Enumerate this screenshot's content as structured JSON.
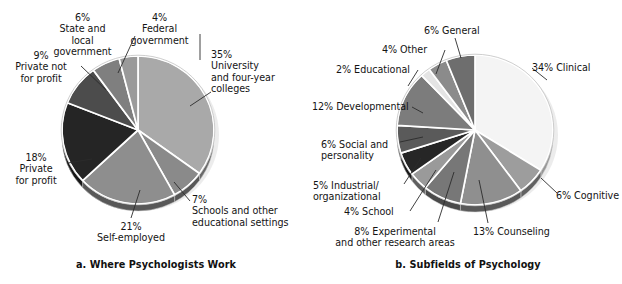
{
  "figure": {
    "panels": [
      {
        "id": "a",
        "caption": "a. Where Psychologists Work",
        "chart_index": 0
      },
      {
        "id": "b",
        "caption": "b. Subfields of Psychology",
        "chart_index": 1
      }
    ]
  },
  "chart_data": [
    {
      "type": "pie",
      "title": "a. Where Psychologists Work",
      "xlabel": "",
      "ylabel": "",
      "legend": "labels-with-leader-lines",
      "start_angle_deg": 0,
      "direction": "clockwise",
      "categories": [
        "University and four-year colleges",
        "Schools and other educational settings",
        "Self-employed",
        "Private for profit",
        "Private not for profit",
        "State and local government",
        "Federal government"
      ],
      "values": [
        35,
        7,
        21,
        18,
        9,
        6,
        4
      ],
      "labels": [
        "35%\nUniversity\nand four-year\ncolleges",
        "7%\nSchools and other\neducational settings",
        "21%\nSelf-employed",
        "18%\nPrivate\nfor profit",
        "9%\nPrivate not\nfor profit",
        "6%\nState and\nlocal\ngovernment",
        "4%\nFederal\ngovernment"
      ],
      "colors": [
        "#a9a9a9",
        "#8a8a8a",
        "#8e8e8e",
        "#252525",
        "#4c4c4c",
        "#7f7f7f",
        "#9a9a9a"
      ]
    },
    {
      "type": "pie",
      "title": "b. Subfields of Psychology",
      "xlabel": "",
      "ylabel": "",
      "legend": "labels-with-leader-lines",
      "start_angle_deg": 0,
      "direction": "clockwise",
      "categories": [
        "Clinical",
        "Cognitive",
        "Counseling",
        "Experimental and other research areas",
        "School",
        "Industrial/organizational",
        "Social and personality",
        "Developmental",
        "Educational",
        "Other",
        "General"
      ],
      "values": [
        34,
        6,
        13,
        8,
        4,
        5,
        6,
        12,
        2,
        4,
        6
      ],
      "labels": [
        "34% Clinical",
        "6% Cognitive",
        "13% Counseling",
        "8% Experimental\nand other research areas",
        "4% School",
        "5% Industrial/\norganizational",
        "6% Social and\npersonality",
        "12% Developmental",
        "2% Educational",
        "4% Other",
        "6% General"
      ],
      "colors": [
        "#f4f4f4",
        "#9d9d9d",
        "#8f8f8f",
        "#777777",
        "#9a9a9a",
        "#262626",
        "#5a5a5a",
        "#7c7c7c",
        "#e4e4e4",
        "#8b8b8b",
        "#6e6e6e"
      ]
    }
  ],
  "labels_a": {
    "university": "35%\nUniversity\nand four-year\ncolleges",
    "schools": "7%\nSchools and other\neducational settings",
    "self_employed": "21%\nSelf-employed",
    "private_for_profit": "18%\nPrivate\nfor profit",
    "private_not_for_profit": "9%\nPrivate not\nfor profit",
    "state_local": "6%\nState and\nlocal\ngovernment",
    "federal": "4%\nFederal\ngovernment"
  },
  "labels_b": {
    "clinical": "34% Clinical",
    "cognitive": "6% Cognitive",
    "counseling": "13% Counseling",
    "experimental": "8% Experimental\nand other research areas",
    "school": "4% School",
    "industrial": "5% Industrial/\norganizational",
    "social": "6% Social and\npersonality",
    "developmental": "12% Developmental",
    "educational": "2% Educational",
    "other": "4% Other",
    "general": "6% General"
  },
  "captions": {
    "a": "a. Where Psychologists Work",
    "b": "b. Subfields of Psychology"
  }
}
